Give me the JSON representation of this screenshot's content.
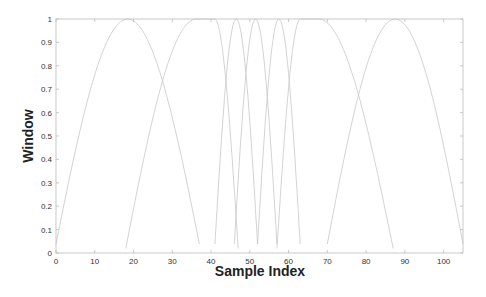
{
  "chart_data": {
    "type": "line",
    "title": "",
    "xlabel": "Sample Index",
    "ylabel": "Window",
    "xlim": [
      0,
      105
    ],
    "ylim": [
      0,
      1
    ],
    "xticks": [
      0,
      10,
      20,
      30,
      40,
      50,
      60,
      70,
      80,
      90,
      100
    ],
    "yticks": [
      0,
      0.1,
      0.2,
      0.3,
      0.4,
      0.5,
      0.6,
      0.7,
      0.8,
      0.9,
      1
    ],
    "grid": false,
    "legend": null,
    "line_color": "#c8c8c8",
    "series": [
      {
        "name": "window-1",
        "segments": [
          {
            "x0": 0,
            "x1": 37
          }
        ]
      },
      {
        "name": "window-2",
        "segments": [
          {
            "x0": 18,
            "x1": 36,
            "rise": true
          },
          {
            "x0": 36,
            "x1": 41,
            "flat": true
          },
          {
            "x0": 41,
            "x1": 47,
            "fall": true
          }
        ]
      },
      {
        "name": "window-3",
        "segments": [
          {
            "x0": 41,
            "x1": 52
          }
        ]
      },
      {
        "name": "window-4",
        "segments": [
          {
            "x0": 46,
            "x1": 57
          }
        ]
      },
      {
        "name": "window-5",
        "segments": [
          {
            "x0": 52,
            "x1": 63
          }
        ]
      },
      {
        "name": "window-6",
        "segments": [
          {
            "x0": 57,
            "x1": 63,
            "rise": true
          },
          {
            "x0": 63,
            "x1": 68,
            "flat": true
          },
          {
            "x0": 68,
            "x1": 87,
            "fall": true
          }
        ]
      },
      {
        "name": "window-7",
        "segments": [
          {
            "x0": 70,
            "x1": 105
          }
        ]
      }
    ]
  }
}
